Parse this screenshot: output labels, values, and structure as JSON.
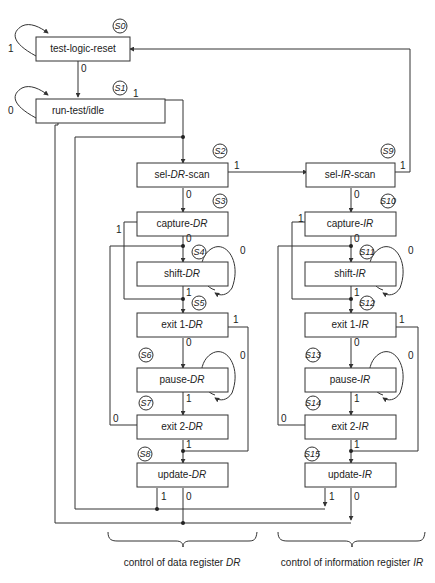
{
  "states": {
    "s0": {
      "id": "S0",
      "pre": "test-logic-reset",
      "it": "",
      "post": ""
    },
    "s1": {
      "id": "S1",
      "pre": "run-test/idle",
      "it": "",
      "post": ""
    },
    "s2": {
      "id": "S2",
      "pre": "sel-",
      "it": "DR",
      "post": "-scan"
    },
    "s3": {
      "id": "S3",
      "pre": "capture-",
      "it": "DR",
      "post": ""
    },
    "s4": {
      "id": "S4",
      "pre": "shift-",
      "it": "DR",
      "post": ""
    },
    "s5": {
      "id": "S5",
      "pre": "exit 1-",
      "it": "DR",
      "post": ""
    },
    "s6": {
      "id": "S6",
      "pre": "pause-",
      "it": "DR",
      "post": ""
    },
    "s7": {
      "id": "S7",
      "pre": "exit 2-",
      "it": "DR",
      "post": ""
    },
    "s8": {
      "id": "S8",
      "pre": "update-",
      "it": "DR",
      "post": ""
    },
    "s9": {
      "id": "S9",
      "pre": "sel-",
      "it": "IR",
      "post": "-scan"
    },
    "s10": {
      "id": "S10",
      "pre": "capture-",
      "it": "IR",
      "post": ""
    },
    "s11": {
      "id": "S11",
      "pre": "shift-",
      "it": "IR",
      "post": ""
    },
    "s12": {
      "id": "S12",
      "pre": "exit 1-",
      "it": "IR",
      "post": ""
    },
    "s13": {
      "id": "S13",
      "pre": "pause-",
      "it": "IR",
      "post": ""
    },
    "s14": {
      "id": "S14",
      "pre": "exit 2-",
      "it": "IR",
      "post": ""
    },
    "s15": {
      "id": "S15",
      "pre": "update-",
      "it": "IR",
      "post": ""
    }
  },
  "bits": {
    "zero": "0",
    "one": "1"
  },
  "captions": {
    "dr": {
      "pre": "control of data register ",
      "it": "DR"
    },
    "ir": {
      "pre": "control of information register ",
      "it": "IR"
    }
  }
}
